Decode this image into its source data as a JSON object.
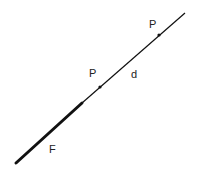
{
  "diagram": {
    "colors": {
      "line": "#111111",
      "text": "#222222",
      "background": "#ffffff"
    },
    "line": {
      "start": [
        16,
        163
      ],
      "end": [
        185,
        13
      ],
      "thick_segment": {
        "from": [
          16,
          163
        ],
        "to": [
          82,
          103
        ],
        "width": 3
      },
      "thin_width": 1.2
    },
    "points": [
      {
        "id": "upper",
        "x": 159,
        "y": 35,
        "label": "P",
        "label_x": 149,
        "label_y": 28
      },
      {
        "id": "middle",
        "x": 100,
        "y": 87,
        "label": "P",
        "label_x": 89,
        "label_y": 77
      }
    ],
    "labels": {
      "distance": {
        "text": "d",
        "x": 131,
        "y": 78
      },
      "force": {
        "text": "F",
        "x": 49,
        "y": 153
      }
    }
  }
}
